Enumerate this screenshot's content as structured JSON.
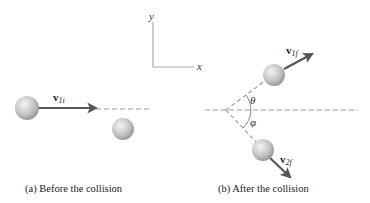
{
  "axes": {
    "x_label": "x",
    "y_label": "y"
  },
  "panel_a": {
    "caption": "(a) Before the collision",
    "velocity_label": {
      "main": "v",
      "sub": "1i"
    }
  },
  "panel_b": {
    "caption": "(b) After the collision",
    "velocity_1": {
      "main": "v",
      "sub": "1f"
    },
    "velocity_2": {
      "main": "v",
      "sub": "2f"
    },
    "angle_theta": "θ",
    "angle_phi": "φ"
  },
  "colors": {
    "vector": "#555555",
    "dashed": "#999999",
    "axis": "#aaaaaa",
    "ball_light": "#f2f2f2",
    "ball_dark": "#9a9a9a"
  }
}
